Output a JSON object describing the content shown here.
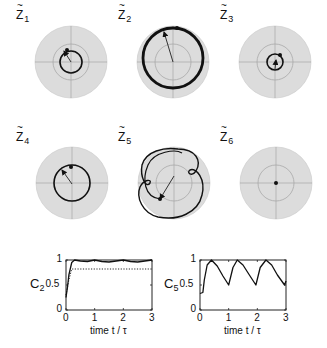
{
  "phasors": [
    {
      "label": "Z",
      "sub": "1",
      "cx": 71,
      "cy": 62,
      "orbit_r": 11,
      "orbit_cx": 71,
      "orbit_cy": 62,
      "arrow": [
        71,
        62,
        64,
        51
      ],
      "dot": [
        67,
        50
      ],
      "stroke": 1.6,
      "type": "circle"
    },
    {
      "label": "Z",
      "sub": "2",
      "cx": 173,
      "cy": 62,
      "orbit_r": 30,
      "orbit_cx": 173,
      "orbit_cy": 58,
      "arrow": [
        173,
        62,
        164,
        32
      ],
      "dot": [
        177,
        28
      ],
      "stroke": 2.8,
      "type": "circle"
    },
    {
      "label": "Z",
      "sub": "3",
      "cx": 275,
      "cy": 62,
      "orbit_r": 8,
      "orbit_cx": 275,
      "orbit_cy": 62,
      "arrow": [
        275,
        69,
        276,
        60
      ],
      "dot": [
        280,
        55
      ],
      "stroke": 1.6,
      "type": "circle"
    },
    {
      "label": "Z",
      "sub": "4",
      "cx": 72,
      "cy": 183,
      "orbit_r": 18,
      "orbit_cx": 72,
      "orbit_cy": 183,
      "arrow": [
        72,
        184,
        62,
        170
      ],
      "dot": [
        71,
        167
      ],
      "stroke": 1.6,
      "type": "circle"
    },
    {
      "label": "Z",
      "sub": "5",
      "cx": 174,
      "cy": 183,
      "orbit_r": 0,
      "arrow": [
        174,
        176,
        160,
        199
      ],
      "dot": [
        160,
        199
      ],
      "stroke": 1.4,
      "type": "epicycle"
    },
    {
      "label": "Z",
      "sub": "6",
      "cx": 276,
      "cy": 183,
      "orbit_r": 0,
      "arrow": null,
      "dot": [
        276,
        183
      ],
      "stroke": 1.4,
      "type": "point"
    }
  ],
  "phasor_style": {
    "outer_r": 36,
    "inner_r": 18,
    "disk_fill": "#dcdcdc",
    "grid_stroke": "#a8a8a8",
    "curve_color": "#111111"
  },
  "chart_data": [
    {
      "type": "line",
      "ylabel": "C",
      "ylabel_sub": "2",
      "xlabel": "time  t / τ",
      "xlim": [
        0,
        3
      ],
      "ylim": [
        0,
        1
      ],
      "xticks": [
        "0",
        "1",
        "2",
        "3"
      ],
      "yticks": [
        "0",
        "0.5",
        "1"
      ],
      "grid": false,
      "series": [
        {
          "name": "C2",
          "style": "solid",
          "x": [
            0,
            0.05,
            0.1,
            0.2,
            0.3,
            0.5,
            0.75,
            1.0,
            1.25,
            1.5,
            1.75,
            2.0,
            2.25,
            2.5,
            2.75,
            3.0
          ],
          "y": [
            0.25,
            0.45,
            0.7,
            0.95,
            1.0,
            0.98,
            0.97,
            1.0,
            0.97,
            0.96,
            0.98,
            1.0,
            0.97,
            0.96,
            0.98,
            1.0
          ]
        },
        {
          "name": "reference",
          "style": "dotted",
          "x": [
            0,
            0.1,
            0.2,
            3.0
          ],
          "y": [
            0.3,
            0.6,
            0.82,
            0.82
          ]
        }
      ]
    },
    {
      "type": "line",
      "ylabel": "C",
      "ylabel_sub": "5",
      "xlabel": "time  t / τ",
      "xlim": [
        0,
        3
      ],
      "ylim": [
        0,
        1
      ],
      "xticks": [
        "0",
        "1",
        "2",
        "3"
      ],
      "yticks": [
        "0",
        "0.5",
        "1"
      ],
      "grid": false,
      "series": [
        {
          "name": "C5",
          "style": "solid",
          "x": [
            0,
            0.1,
            0.15,
            0.25,
            0.4,
            0.6,
            0.8,
            1.0,
            1.15,
            1.3,
            1.5,
            1.7,
            1.95,
            2.1,
            2.3,
            2.5,
            2.7,
            2.95,
            3.0
          ],
          "y": [
            0.33,
            0.35,
            0.6,
            0.9,
            1.0,
            0.88,
            0.68,
            0.5,
            0.85,
            1.0,
            0.9,
            0.72,
            0.5,
            0.85,
            1.0,
            0.9,
            0.7,
            0.5,
            0.58
          ]
        }
      ]
    }
  ],
  "plots_layout": [
    {
      "left": 66,
      "top": 260,
      "right": 152,
      "bottom": 310
    },
    {
      "left": 200,
      "top": 260,
      "right": 286,
      "bottom": 310
    }
  ]
}
